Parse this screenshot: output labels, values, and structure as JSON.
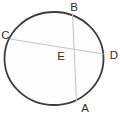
{
  "figure": {
    "type": "geometry-diagram",
    "points": {
      "A": {
        "label": "A",
        "position": "bottom-on-circle"
      },
      "B": {
        "label": "B",
        "position": "top-on-circle"
      },
      "C": {
        "label": "C",
        "position": "upper-left-on-circle"
      },
      "D": {
        "label": "D",
        "position": "right-on-circle"
      },
      "E": {
        "label": "E",
        "position": "chord-intersection-inside-circle"
      }
    },
    "chords": [
      {
        "from": "C",
        "to": "D"
      },
      {
        "from": "B",
        "to": "A"
      }
    ],
    "colors": {
      "background": "#ffffff",
      "circle_fill": "#fdfdfd",
      "circle_stroke": "#3d3d3d",
      "chord_stroke": "#c4c4c4",
      "label_color": "#2e2e2e"
    }
  }
}
